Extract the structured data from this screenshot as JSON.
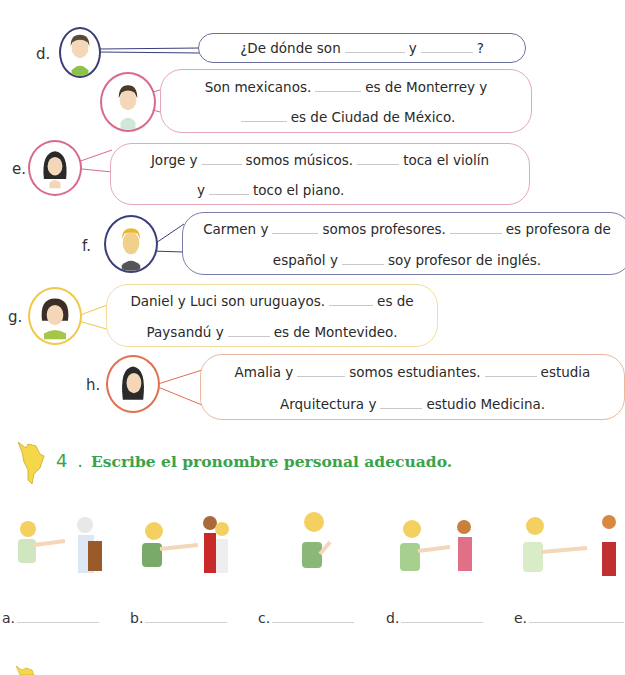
{
  "colors": {
    "navy": "#3a3f7a",
    "pink": "#d86a8a",
    "yellow": "#f0c84a",
    "orange": "#e07050",
    "green_heading": "#3aa34a"
  },
  "dialogues": [
    {
      "letter": "d.",
      "speakers": [
        {
          "lines": [
            [
              "¿De dónde son ",
              "_",
              " y ",
              "_",
              " ?"
            ]
          ]
        },
        {
          "lines": [
            [
              "Son mexicanos. ",
              "_",
              " es de Monterrey y"
            ],
            [
              "_",
              " es de Ciudad de México."
            ]
          ]
        }
      ]
    },
    {
      "letter": "e.",
      "lines": [
        [
          "Jorge y ",
          "_",
          " somos músicos. ",
          "_",
          " toca el violín"
        ],
        [
          "y ",
          "_",
          " toco el piano."
        ]
      ]
    },
    {
      "letter": "f.",
      "lines": [
        [
          "Carmen y ",
          "_",
          " somos profesores. ",
          "_",
          " es profesora de"
        ],
        [
          "español y ",
          "_",
          " soy profesor de inglés."
        ]
      ]
    },
    {
      "letter": "g.",
      "lines": [
        [
          "Daniel y Luci son uruguayos. ",
          "_",
          " es de"
        ],
        [
          "Paysandú y ",
          "_",
          " es de Montevideo."
        ]
      ]
    },
    {
      "letter": "h.",
      "lines": [
        [
          "Amalia y ",
          "_",
          " somos estudiantes. ",
          "_",
          " estudia"
        ],
        [
          "Arquitectura y ",
          "_",
          " estudio Medicina."
        ]
      ]
    }
  ],
  "d_q_text1": "¿De dónde son",
  "d_q_text2": "y",
  "d_q_text3": "?",
  "d_a1_text1": "Son mexicanos.",
  "d_a1_text2": "es de Monterrey y",
  "d_a2_text1": "es de Ciudad de México.",
  "e_l1_t1": "Jorge y",
  "e_l1_t2": "somos músicos.",
  "e_l1_t3": "toca el violín",
  "e_l2_t1": "y",
  "e_l2_t2": "toco el piano.",
  "f_l1_t1": "Carmen y",
  "f_l1_t2": "somos profesores.",
  "f_l1_t3": "es profesora de",
  "f_l2_t1": "español y",
  "f_l2_t2": "soy profesor de inglés.",
  "g_l1_t1": "Daniel y Luci son uruguayos.",
  "g_l1_t2": "es de",
  "g_l2_t1": "Paysandú y",
  "g_l2_t2": "es de Montevideo.",
  "h_l1_t1": "Amalia y",
  "h_l1_t2": "somos estudiantes.",
  "h_l1_t3": "estudia",
  "h_l2_t1": "Arquitectura y",
  "h_l2_t2": "estudio Medicina.",
  "exercise": {
    "number": "4 .",
    "title": "Escribe el pronombre personal adecuado.",
    "icon": "south-america-map-icon"
  },
  "answers": [
    "a.",
    "b.",
    "c.",
    "d.",
    "e."
  ]
}
